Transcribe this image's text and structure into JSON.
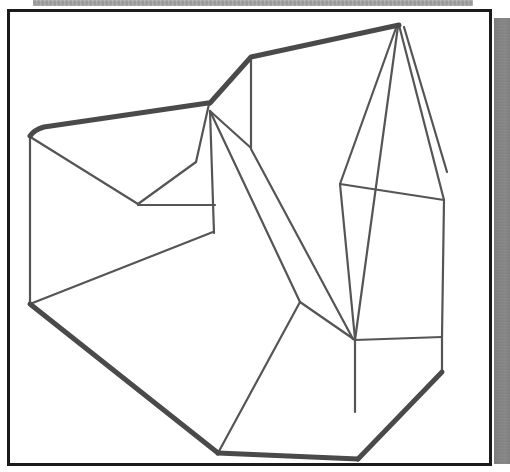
{
  "document": {
    "kind": "scanned-technical-drawing",
    "title": "Wireframe drawing of a polyhedral solid",
    "page_background": "#ffffff",
    "ink_color": "#555555",
    "frame_color": "#1a1a1a"
  },
  "frame": {
    "name": "drawing-border",
    "x": 7,
    "y": 9,
    "width": 485,
    "height": 457,
    "border_width": 3,
    "border_color": "#1a1a1a",
    "fill": "#ffffff"
  },
  "artifacts": {
    "top_noise_band": {
      "label": "scanner noise band",
      "x": 33,
      "y": 0,
      "width": 440,
      "height": 6,
      "color": "#9a9a9a"
    },
    "right_grey_strip": {
      "label": "scanner edge shadow",
      "x": 494,
      "y": 18,
      "width": 16,
      "height": 446,
      "color": "#8a8a8a"
    }
  },
  "drawing": {
    "name": "polyhedral-solid-wireframe",
    "view": "isometric",
    "stroke_color": "#555555",
    "stroke_color_heavy": "#4a4a4a",
    "stroke_width_thin": 2.2,
    "stroke_width_heavy": 5.0,
    "viewbox": "0 0 485 457",
    "vertices": {
      "A": [
        20,
        124
      ],
      "B": [
        199,
        91
      ],
      "C": [
        201,
        13
      ],
      "D": [
        388,
        13
      ],
      "E": [
        20,
        292
      ],
      "F": [
        128,
        191
      ],
      "G": [
        186,
        151
      ],
      "H": [
        204,
        220
      ],
      "I": [
        205,
        254
      ],
      "J": [
        200,
        326
      ],
      "K": [
        330,
        172
      ],
      "L": [
        388,
        318
      ],
      "M": [
        434,
        188
      ],
      "N": [
        437,
        157
      ],
      "P": [
        242,
        45
      ],
      "Q": [
        345,
        392
      ],
      "R": [
        398,
        378
      ],
      "S": [
        260,
        408
      ],
      "T": [
        348,
        447
      ],
      "U": [
        208,
        441
      ],
      "V": [
        345,
        328
      ]
    },
    "edges_heavy": [
      "A-B silhouette top-left",
      "B-D silhouette top ridge",
      "E-U bottom-left silhouette",
      "U-T bottom silhouette",
      "T-R lower-right silhouette"
    ],
    "face_count_visible": 11,
    "description": "Wireframe line drawing of a multi-faceted block with a V notch on the upper-left face, a tall angular prism on the right, and a rectangular base plinth at bottom centre."
  }
}
